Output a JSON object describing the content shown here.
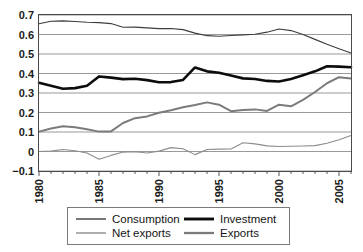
{
  "chart_data": {
    "type": "line",
    "title": "",
    "subtitle": "",
    "xlabel": "",
    "ylabel": "",
    "xlim": [
      1980,
      2006
    ],
    "ylim": [
      -0.1,
      0.7
    ],
    "grid": true,
    "grid_axis": "y",
    "legend_position": "bottom",
    "legend_columns": 2,
    "x": [
      1980,
      1981,
      1982,
      1983,
      1984,
      1985,
      1986,
      1987,
      1988,
      1989,
      1990,
      1991,
      1992,
      1993,
      1994,
      1995,
      1996,
      1997,
      1998,
      1999,
      2000,
      2001,
      2002,
      2003,
      2004,
      2005,
      2006
    ],
    "xticks": [
      1980,
      1985,
      1990,
      1995,
      2000,
      2005
    ],
    "xtick_labels": [
      "1980",
      "1985",
      "1990",
      "1995",
      "2000",
      "2005"
    ],
    "yticks": [
      -0.1,
      0,
      0.1,
      0.2,
      0.3,
      0.4,
      0.5,
      0.6,
      0.7
    ],
    "ytick_labels": [
      "−0.1",
      "0",
      "0.1",
      "0.2",
      "0.3",
      "0.4",
      "0.5",
      "0.6",
      "0.7"
    ],
    "series": [
      {
        "name": "Consumption",
        "color": "#3d3d3d",
        "width": 1.1,
        "values": [
          0.655,
          0.668,
          0.67,
          0.667,
          0.663,
          0.661,
          0.656,
          0.637,
          0.638,
          0.634,
          0.63,
          0.631,
          0.625,
          0.607,
          0.594,
          0.591,
          0.595,
          0.598,
          0.601,
          0.612,
          0.628,
          0.62,
          0.6,
          0.575,
          0.55,
          0.527,
          0.505
        ]
      },
      {
        "name": "Investment",
        "color": "#0c0c0c",
        "width": 2.6,
        "values": [
          0.352,
          0.337,
          0.322,
          0.325,
          0.337,
          0.385,
          0.379,
          0.371,
          0.373,
          0.366,
          0.355,
          0.356,
          0.367,
          0.431,
          0.411,
          0.404,
          0.39,
          0.375,
          0.372,
          0.362,
          0.359,
          0.372,
          0.391,
          0.411,
          0.437,
          0.435,
          0.432
        ]
      },
      {
        "name": "Net exports",
        "color": "#8c8c8c",
        "width": 1.1,
        "values": [
          0.0,
          0.002,
          0.01,
          0.004,
          -0.008,
          -0.04,
          -0.02,
          -0.003,
          -0.001,
          -0.008,
          0.002,
          0.02,
          0.014,
          -0.016,
          0.01,
          0.012,
          0.013,
          0.045,
          0.039,
          0.029,
          0.026,
          0.027,
          0.028,
          0.03,
          0.042,
          0.06,
          0.082
        ]
      },
      {
        "name": "Exports",
        "color": "#7b7b7b",
        "width": 2.0,
        "values": [
          0.102,
          0.118,
          0.13,
          0.124,
          0.114,
          0.102,
          0.103,
          0.146,
          0.171,
          0.18,
          0.199,
          0.212,
          0.227,
          0.238,
          0.252,
          0.24,
          0.207,
          0.213,
          0.216,
          0.208,
          0.24,
          0.232,
          0.265,
          0.305,
          0.35,
          0.381,
          0.374
        ]
      }
    ]
  },
  "legend": {
    "entries": [
      {
        "label": "Consumption"
      },
      {
        "label": "Investment"
      },
      {
        "label": "Net exports"
      },
      {
        "label": "Exports"
      }
    ]
  }
}
